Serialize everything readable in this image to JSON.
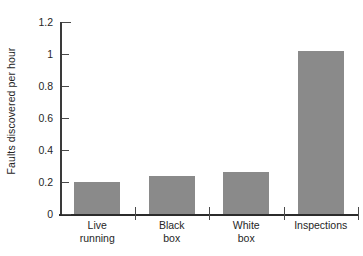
{
  "chart_data": {
    "type": "bar",
    "title": "",
    "xlabel": "",
    "ylabel": "Faults discovered per hour",
    "categories": [
      "Live running",
      "Black box",
      "White box",
      "Inspections"
    ],
    "category_lines": [
      [
        "Live",
        "running"
      ],
      [
        "Black",
        "box"
      ],
      [
        "White",
        "box"
      ],
      [
        "Inspections"
      ]
    ],
    "values": [
      0.2,
      0.235,
      0.265,
      1.02
    ],
    "ylim": [
      0,
      1.2
    ],
    "ytick_labels": [
      "0",
      "0.2",
      "0.4",
      "0.6",
      "0.8",
      "1",
      "1.2"
    ],
    "ytick_values": [
      0,
      0.2,
      0.4,
      0.6,
      0.8,
      1,
      1.2
    ],
    "grid": false,
    "legend": null,
    "colors": {
      "background": "#ffffff",
      "bar_fill": "#8a8a8a",
      "axis": "#2b2b2b",
      "text": "#262626"
    }
  }
}
